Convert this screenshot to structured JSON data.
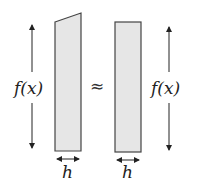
{
  "diagram": {
    "left_label": "f(x)",
    "right_label": "f(x)",
    "approx_symbol": "≈",
    "left_width_label": "h",
    "right_width_label": "h",
    "colors": {
      "fill": "#e6e6e6",
      "stroke": "#444444",
      "text": "#222222"
    }
  }
}
